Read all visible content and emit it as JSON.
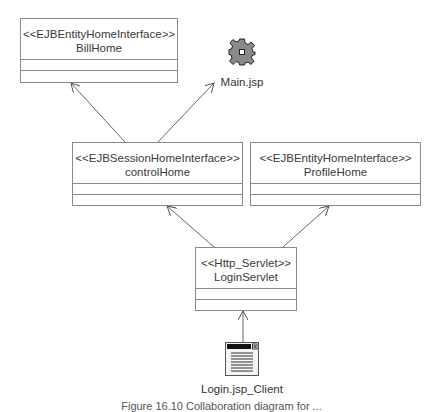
{
  "diagram": {
    "nodes": {
      "bill_home": {
        "stereotype": "<<EJBEntityHomeInterface>>",
        "name": "BillHome"
      },
      "main_jsp": {
        "label": "Main.jsp",
        "icon": "gear-icon"
      },
      "control_home": {
        "stereotype": "<<EJBSessionHomeInterface>>",
        "name": "controlHome"
      },
      "profile_home": {
        "stereotype": "<<EJBEntityHomeInterface>>",
        "name": "ProfileHome"
      },
      "login_servlet": {
        "stereotype": "<<Http_Servlet>>",
        "name": "LoginServlet"
      },
      "login_client": {
        "label": "Login.jsp_Client",
        "icon": "web-page-icon"
      }
    },
    "edges": [
      {
        "from": "controlHome",
        "to": "BillHome"
      },
      {
        "from": "controlHome",
        "to": "Main.jsp"
      },
      {
        "from": "LoginServlet",
        "to": "controlHome"
      },
      {
        "from": "LoginServlet",
        "to": "ProfileHome"
      },
      {
        "from": "Login.jsp_Client",
        "to": "LoginServlet"
      }
    ],
    "caption": "Figure 16.10 Collaboration diagram for ..."
  }
}
